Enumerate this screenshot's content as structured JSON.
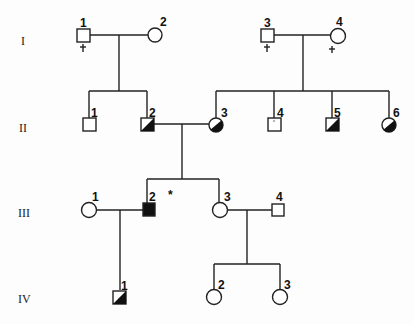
{
  "pedigree": {
    "generations": [
      {
        "label": "I",
        "y": 41
      },
      {
        "label": "II",
        "y": 128
      },
      {
        "label": "III",
        "y": 213
      },
      {
        "label": "IV",
        "y": 299
      }
    ],
    "individuals": [
      {
        "id": "I-1",
        "num": "1",
        "sex": "male",
        "x": 83,
        "y": 36,
        "status": "unaffected",
        "deceased": true
      },
      {
        "id": "I-2",
        "num": "2",
        "sex": "female",
        "x": 155,
        "y": 36,
        "status": "unaffected",
        "deceased": false
      },
      {
        "id": "I-3",
        "num": "3",
        "sex": "male",
        "x": 267,
        "y": 36,
        "status": "unaffected",
        "deceased": true
      },
      {
        "id": "I-4",
        "num": "4",
        "sex": "female",
        "x": 338,
        "y": 36,
        "status": "unaffected",
        "deceased": true
      },
      {
        "id": "II-1",
        "num": "1",
        "sex": "male",
        "x": 89,
        "y": 125,
        "status": "unaffected"
      },
      {
        "id": "II-2",
        "num": "2",
        "sex": "male",
        "x": 147,
        "y": 125,
        "status": "carrier-half"
      },
      {
        "id": "II-3",
        "num": "3",
        "sex": "female",
        "x": 216,
        "y": 125,
        "status": "carrier-quarter"
      },
      {
        "id": "II-4",
        "num": "4",
        "sex": "male",
        "x": 274,
        "y": 125,
        "status": "unaffected"
      },
      {
        "id": "II-5",
        "num": "5",
        "sex": "male",
        "x": 332,
        "y": 125,
        "status": "carrier-half"
      },
      {
        "id": "II-6",
        "num": "6",
        "sex": "female",
        "x": 389,
        "y": 125,
        "status": "carrier-quarter"
      },
      {
        "id": "III-1",
        "num": "1",
        "sex": "female",
        "x": 89,
        "y": 210,
        "status": "unaffected"
      },
      {
        "id": "III-2",
        "num": "2",
        "sex": "male",
        "x": 149,
        "y": 210,
        "status": "affected",
        "proband_mark": "*"
      },
      {
        "id": "III-3",
        "num": "3",
        "sex": "female",
        "x": 220,
        "y": 210,
        "status": "unaffected"
      },
      {
        "id": "III-4",
        "num": "4",
        "sex": "male",
        "x": 278,
        "y": 210,
        "status": "unaffected"
      },
      {
        "id": "IV-1",
        "num": "1",
        "sex": "male",
        "x": 119,
        "y": 297,
        "status": "carrier-half"
      },
      {
        "id": "IV-2",
        "num": "2",
        "sex": "female",
        "x": 214,
        "y": 297,
        "status": "unaffected"
      },
      {
        "id": "IV-3",
        "num": "3",
        "sex": "female",
        "x": 280,
        "y": 297,
        "status": "unaffected"
      }
    ],
    "proband_marker": "*",
    "deceased_marker": "✝",
    "colors": {
      "line": "#222222",
      "fill_affected": "#111111",
      "background": "#fdfdfd"
    }
  }
}
